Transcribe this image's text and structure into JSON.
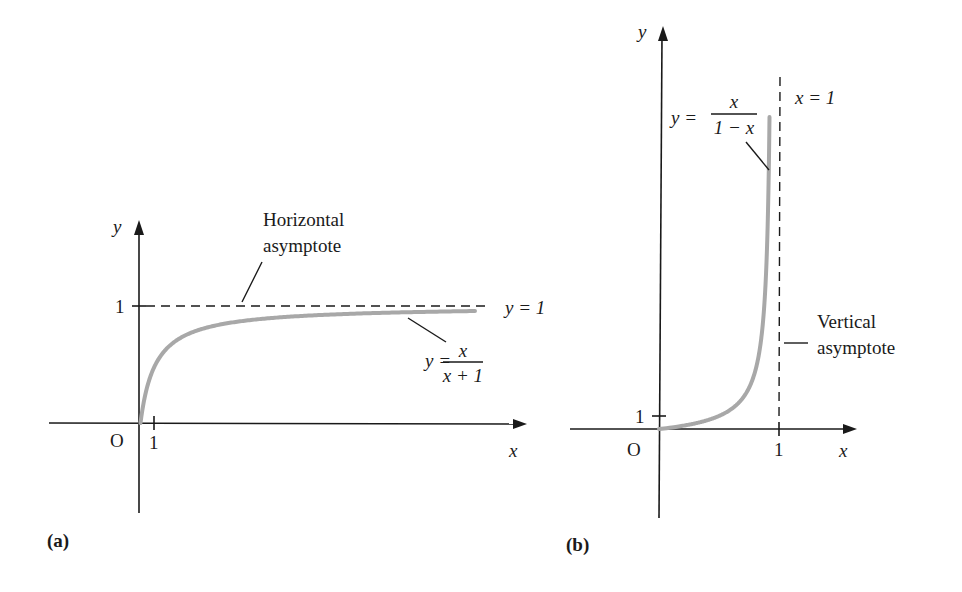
{
  "figure": {
    "curve_color": "#a8a8a8",
    "axis_color": "#1a1a1a"
  },
  "chart_data": [
    {
      "type": "line",
      "panel_label": "(a)",
      "function": "y = x/(x+1)",
      "xlabel": "x",
      "ylabel": "y",
      "origin_label": "O",
      "x_ticks": [
        {
          "value": 1,
          "label": "1"
        }
      ],
      "y_ticks": [
        {
          "value": 1,
          "label": "1"
        }
      ],
      "xlim": [
        -6,
        26
      ],
      "ylim": [
        -0.75,
        1.7
      ],
      "curve_domain": [
        0,
        22.3
      ],
      "asymptote": {
        "kind": "horizontal",
        "value": 1,
        "equation_label": "y = 1",
        "callout": [
          "Horizontal",
          "asymptote"
        ]
      },
      "curve_label": {
        "lhs": "y =",
        "numerator": "x",
        "denominator": "x + 1"
      }
    },
    {
      "type": "line",
      "panel_label": "(b)",
      "function": "y = x/(1-x)",
      "xlabel": "x",
      "ylabel": "y",
      "origin_label": "O",
      "x_ticks": [
        {
          "value": 1,
          "label": "1"
        }
      ],
      "y_ticks": [
        {
          "value": 1,
          "label": "1"
        }
      ],
      "xlim": [
        -0.75,
        1.63
      ],
      "ylim": [
        -7,
        31
      ],
      "curve_domain": [
        0,
        0.96
      ],
      "asymptote": {
        "kind": "vertical",
        "value": 1,
        "equation_label": "x = 1",
        "callout": [
          "Vertical",
          "asymptote"
        ]
      },
      "curve_label": {
        "lhs": "y =",
        "numerator": "x",
        "denominator": "1 − x"
      }
    }
  ]
}
